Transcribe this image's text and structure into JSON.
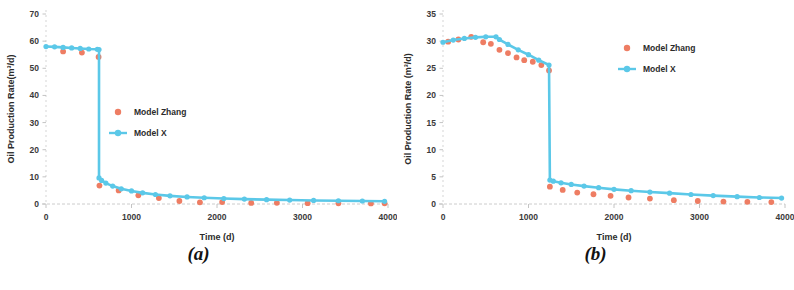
{
  "figure": {
    "panels": [
      {
        "caption": "(a)",
        "chart_data": {
          "type": "line",
          "title": "",
          "xlabel": "Time (d)",
          "ylabel": "Oil Production Rate(m³/d)",
          "xlim": [
            0,
            4000
          ],
          "ylim": [
            0,
            70
          ],
          "xticks": [
            0,
            1000,
            2000,
            3000,
            4000
          ],
          "yticks": [
            0,
            10,
            20,
            30,
            40,
            50,
            60,
            70
          ],
          "grid": false,
          "legend_position": "center",
          "series": [
            {
              "name": "Model Zhang",
              "style": "markers",
              "color": "#EE7D63",
              "x": [
                200,
                420,
                615,
                625,
                850,
                1080,
                1320,
                1560,
                1800,
                2060,
                2400,
                2700,
                3060,
                3420,
                3800,
                3960
              ],
              "y": [
                56.2,
                55.8,
                54.2,
                6.8,
                5.0,
                3.2,
                2.2,
                1.1,
                0.6,
                0.7,
                0.4,
                0.45,
                0.3,
                0.25,
                0.2,
                0.25
              ]
            },
            {
              "name": "Model X",
              "style": "line+markers",
              "color": "#5BC8E8",
              "x": [
                0,
                100,
                200,
                300,
                400,
                500,
                600,
                620,
                620,
                650,
                700,
                780,
                880,
                1000,
                1130,
                1280,
                1450,
                1650,
                1850,
                2080,
                2320,
                2580,
                2850,
                3130,
                3420,
                3700,
                3960
              ],
              "y": [
                58.0,
                57.9,
                57.7,
                57.5,
                57.3,
                57.1,
                57.0,
                56.9,
                9.6,
                8.7,
                7.7,
                6.6,
                5.6,
                4.8,
                4.1,
                3.5,
                3.0,
                2.6,
                2.3,
                2.0,
                1.8,
                1.6,
                1.45,
                1.3,
                1.2,
                1.1,
                1.0
              ]
            }
          ]
        }
      },
      {
        "caption": "(b)",
        "chart_data": {
          "type": "line",
          "title": "",
          "xlabel": "Time (d)",
          "ylabel": "Oil Production Rate (m³/d)",
          "xlim": [
            0,
            4000
          ],
          "ylim": [
            0,
            35
          ],
          "xticks": [
            0,
            1000,
            2000,
            3000,
            4000
          ],
          "yticks": [
            0,
            5,
            10,
            15,
            20,
            25,
            30,
            35
          ],
          "grid": false,
          "legend_position": "upper-right",
          "series": [
            {
              "name": "Model Zhang",
              "style": "markers",
              "color": "#EE7D63",
              "x": [
                60,
                180,
                330,
                470,
                560,
                660,
                760,
                860,
                950,
                1050,
                1150,
                1240,
                1250,
                1400,
                1570,
                1760,
                1960,
                2170,
                2420,
                2700,
                2980,
                3280,
                3560,
                3840
              ],
              "y": [
                29.9,
                30.3,
                30.8,
                29.8,
                29.5,
                28.4,
                27.8,
                27.0,
                26.5,
                26.2,
                25.6,
                24.6,
                3.2,
                2.6,
                2.1,
                1.8,
                1.5,
                1.2,
                1.0,
                0.7,
                0.55,
                0.45,
                0.4,
                0.35
              ]
            },
            {
              "name": "Model X",
              "style": "line+markers",
              "color": "#5BC8E8",
              "x": [
                0,
                120,
                250,
                380,
                500,
                620,
                660,
                760,
                880,
                1000,
                1120,
                1240,
                1250,
                1290,
                1380,
                1500,
                1650,
                1820,
                2000,
                2200,
                2420,
                2650,
                2900,
                3160,
                3440,
                3700,
                3960
              ],
              "y": [
                29.8,
                30.2,
                30.5,
                30.7,
                30.8,
                30.8,
                30.3,
                29.4,
                28.4,
                27.5,
                26.5,
                25.6,
                4.4,
                4.2,
                3.9,
                3.6,
                3.3,
                3.0,
                2.7,
                2.45,
                2.2,
                2.0,
                1.75,
                1.55,
                1.35,
                1.2,
                1.1
              ]
            }
          ]
        }
      }
    ]
  },
  "colors": {
    "model_zhang": "#EE7D63",
    "model_x": "#5BC8E8",
    "axis": "#b9b9b9",
    "text": "#2b2b2b"
  }
}
